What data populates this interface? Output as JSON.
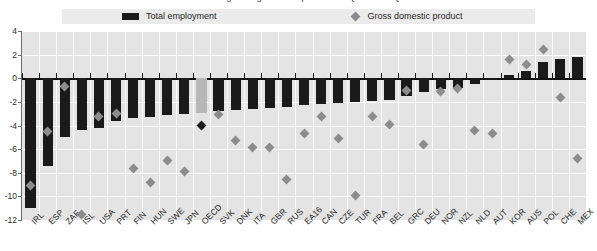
{
  "title": {
    "clipped_text": "Percentage change over the period 2007 Q4 to 2009 Q2"
  },
  "legend": {
    "position": "top",
    "items": [
      {
        "label": "Total employment",
        "marker": "bar",
        "color": "#1a1a1a"
      },
      {
        "label": "Gross domestic product",
        "marker": "diamond",
        "color": "#8c8c8c"
      }
    ]
  },
  "axis": {
    "y_ticks": [
      "4",
      "2",
      "0",
      "-2",
      "-4",
      "-6",
      "-8",
      "-10",
      "-12"
    ],
    "y_min": -12,
    "y_max": 4,
    "y_step": 2
  },
  "highlight": {
    "category": "OECD",
    "bar_color": "#b8b8b8",
    "marker_color": "#1a1a1a"
  },
  "chart_data": {
    "type": "bar",
    "title": "Percentage change over the period 2007 Q4 to 2009 Q2",
    "xlabel": "",
    "ylabel": "",
    "ylim": [
      -12,
      4
    ],
    "grid": true,
    "legend_position": "top",
    "categories": [
      "IRL",
      "ESP",
      "ZAF",
      "ISL",
      "USA",
      "PRT",
      "FIN",
      "HUN",
      "SWE",
      "JPN",
      "OECD",
      "SVK",
      "DNK",
      "ITA",
      "GBR",
      "RUS",
      "EA16",
      "CAN",
      "CZE",
      "TUR",
      "FRA",
      "BEL",
      "GRC",
      "DEU",
      "NOR",
      "NZL",
      "NLD",
      "AUT",
      "KOR",
      "AUS",
      "POL",
      "CHE",
      "MEX"
    ],
    "series": [
      {
        "name": "Total employment",
        "type": "bar",
        "color": "#1a1a1a",
        "values": [
          -11.0,
          -7.4,
          -5.0,
          -4.4,
          -4.2,
          -3.6,
          -3.4,
          -3.3,
          -3.1,
          -3.0,
          -2.9,
          -2.8,
          -2.7,
          -2.6,
          -2.5,
          -2.4,
          -2.3,
          -2.2,
          -2.1,
          -2.0,
          -1.9,
          -1.8,
          -1.5,
          -1.2,
          -0.9,
          -0.8,
          -0.5,
          0.0,
          0.3,
          0.6,
          1.4,
          1.6,
          1.8
        ]
      },
      {
        "name": "Gross domestic product",
        "type": "scatter",
        "marker": "diamond",
        "color": "#8c8c8c",
        "values": [
          -9.1,
          -4.5,
          -0.7,
          -11.5,
          -3.2,
          -3.0,
          -7.6,
          -8.8,
          -7.0,
          -7.9,
          -4.0,
          -3.1,
          -5.3,
          -5.9,
          -5.9,
          -8.6,
          -4.7,
          -3.2,
          -5.1,
          -9.9,
          -3.2,
          -3.9,
          -1.0,
          -5.6,
          -1.1,
          -0.9,
          -4.4,
          -4.7,
          1.6,
          1.2,
          2.4,
          -1.6,
          -6.8
        ]
      }
    ]
  }
}
